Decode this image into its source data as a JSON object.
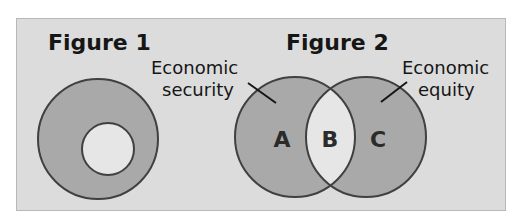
{
  "figures": [
    {
      "title": "Figure 1",
      "shapes": {
        "outer_circle": {
          "cx": 98,
          "cy": 139,
          "r": 60
        },
        "inner_circle": {
          "cx": 108,
          "cy": 149,
          "r": 26
        }
      }
    },
    {
      "title": "Figure 2",
      "left_label": {
        "line1": "Economic",
        "line2": "security"
      },
      "right_label": {
        "line1": "Economic",
        "line2": "equity"
      },
      "regions": {
        "a": "A",
        "b": "B",
        "c": "C"
      },
      "shapes": {
        "left_circle": {
          "cx": 295,
          "cy": 137,
          "r": 60
        },
        "right_circle": {
          "cx": 366,
          "cy": 137,
          "r": 60
        }
      }
    }
  ],
  "colors": {
    "panel_background": "#dcdcdc",
    "shaded_fill": "#a9a9a9",
    "unshaded_fill": "#e6e6e6",
    "outline": "#404040",
    "text": "#161616"
  }
}
